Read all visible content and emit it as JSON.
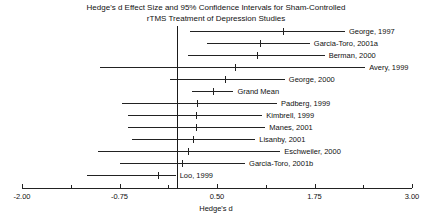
{
  "chart_data": {
    "type": "forest",
    "title": "Hedge's d Effect Size and 95% Confidence Intervals for Sham-Controlled rTMS Treatment of Depression Studies",
    "title_line1": "Hedge's d Effect Size and 95% Confidence Intervals for Sham-Controlled",
    "title_line2": "rTMS Treatment of Depression Studies",
    "xlabel": "Hedge's d",
    "ylabel": "",
    "xlim": [
      -2.0,
      3.0
    ],
    "grid": false,
    "reference_line": 0.0,
    "tick_labels": [
      "-2.00",
      "-0.75",
      "0.50",
      "1.75",
      "3.00"
    ],
    "tick_values": [
      -2.0,
      -0.75,
      0.5,
      1.75,
      3.0
    ],
    "minor_tick_values": [
      -1.375,
      -0.125,
      1.125,
      2.375
    ],
    "categories": [
      "George, 1997",
      "Garcia-Toro, 2001a",
      "Berman, 2000",
      "Avery, 1999",
      "George, 2000",
      "Grand Mean",
      "Padberg, 1999",
      "Kimbrell, 1999",
      "Manes, 2001",
      "Lisanby, 2001",
      "Eschweiler, 2000",
      "Garcia-Toro, 2001b",
      "Loo, 1999"
    ],
    "points": [
      {
        "label": "George, 1997",
        "effect": 1.35,
        "ci_low": 0.15,
        "ci_high": 2.14
      },
      {
        "label": "Garcia-Toro, 2001a",
        "effect": 1.05,
        "ci_low": 0.37,
        "ci_high": 1.69
      },
      {
        "label": "Berman, 2000",
        "effect": 1.01,
        "ci_low": 0.13,
        "ci_high": 1.88
      },
      {
        "label": "Avery, 1999",
        "effect": 0.73,
        "ci_low": -1.0,
        "ci_high": 2.4
      },
      {
        "label": "George, 2000",
        "effect": 0.6,
        "ci_low": -0.1,
        "ci_high": 1.37
      },
      {
        "label": "Grand Mean",
        "effect": 0.45,
        "ci_low": 0.18,
        "ci_high": 0.71
      },
      {
        "label": "Padberg, 1999",
        "effect": 0.24,
        "ci_low": -0.72,
        "ci_high": 1.27
      },
      {
        "label": "Kimbrell, 1999",
        "effect": 0.23,
        "ci_low": -0.64,
        "ci_high": 1.08
      },
      {
        "label": "Manes, 2001",
        "effect": 0.23,
        "ci_low": -0.64,
        "ci_high": 1.12
      },
      {
        "label": "Lisanby, 2001",
        "effect": 0.19,
        "ci_low": -0.59,
        "ci_high": 0.99
      },
      {
        "label": "Eschweiler, 2000",
        "effect": 0.13,
        "ci_low": -1.03,
        "ci_high": 1.31
      },
      {
        "label": "Garcia-Toro, 2001b",
        "effect": 0.05,
        "ci_low": -0.74,
        "ci_high": 0.86
      },
      {
        "label": "Loo, 1999",
        "effect": -0.26,
        "ci_low": -1.17,
        "ci_high": -0.03
      }
    ]
  }
}
